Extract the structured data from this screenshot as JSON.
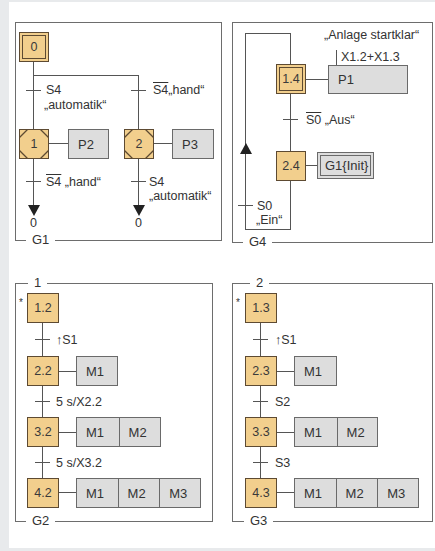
{
  "colors": {
    "step_fill": "#f2cf8d",
    "action_fill": "#dddddd",
    "line": "#555555",
    "frame": "#6d6d6d"
  },
  "g1": {
    "label": "G1",
    "initial_step": "0",
    "branch_left": {
      "transition_var": "S4",
      "transition_text": "„automatik“",
      "step": "1",
      "action": "P2",
      "exit_var": "S4",
      "exit_text": "„hand“",
      "target": "0"
    },
    "branch_right": {
      "transition_var": "S4",
      "transition_text": "„hand“",
      "step": "2",
      "action": "P3",
      "exit_var": "S4",
      "exit_text": "„automatik“",
      "target": "0"
    }
  },
  "g4": {
    "label": "G4",
    "annotation": "„Anlage startklar“",
    "step1": "1.4",
    "action1": "P1",
    "action1_condition": "X1.2+X1.3",
    "transition1_var": "S0",
    "transition1_text": "„Aus“",
    "step2": "2.4",
    "action2": "G1{Init}",
    "transition2_var": "S0",
    "transition2_text": "„Ein“"
  },
  "g2": {
    "label": "G2",
    "partition": "1",
    "marker": "*",
    "steps": [
      {
        "id": "1.2",
        "actions": []
      },
      {
        "id": "2.2",
        "actions": [
          "M1"
        ]
      },
      {
        "id": "3.2",
        "actions": [
          "M1",
          "M2"
        ]
      },
      {
        "id": "4.2",
        "actions": [
          "M1",
          "M2",
          "M3"
        ]
      }
    ],
    "transitions": [
      "↑S1",
      "5 s/X2.2",
      "5 s/X3.2"
    ]
  },
  "g3": {
    "label": "G3",
    "partition": "2",
    "marker": "*",
    "steps": [
      {
        "id": "1.3",
        "actions": []
      },
      {
        "id": "2.3",
        "actions": [
          "M1"
        ]
      },
      {
        "id": "3.3",
        "actions": [
          "M1",
          "M2"
        ]
      },
      {
        "id": "4.3",
        "actions": [
          "M1",
          "M2",
          "M3"
        ]
      }
    ],
    "transitions": [
      "↑S1",
      "S2",
      "S3"
    ]
  }
}
